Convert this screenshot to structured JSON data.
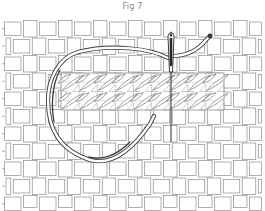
{
  "figure": {
    "caption": "Fig 7"
  },
  "canvas": {
    "left": 4,
    "top": 20,
    "right": 262,
    "bottom": 208,
    "cell_w": 17.5,
    "cell_h": 17.5,
    "line_color": "#8c8c8c"
  },
  "stitch_band": {
    "left": 61,
    "top": 73,
    "right": 224,
    "bottom": 110,
    "fill": "#ffffff",
    "line_color": "#7a7a7a",
    "columns": 9,
    "rows": 2
  },
  "thread": {
    "color": "#3a3a3a",
    "fill": "#ffffff"
  },
  "needle": {
    "x": 171,
    "top": 30,
    "bottom": 142,
    "color": "#2a2a2a"
  }
}
